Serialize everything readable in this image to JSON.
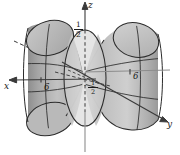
{
  "figure": {
    "kind": "3d-surface-plot",
    "surface_name": "hyperboloid-of-one-sheet",
    "background_color": "#ffffff",
    "outline_color": "#2b2b2b",
    "fill_light": "#d8d8d8",
    "fill_mid": "#b4b4b4",
    "fill_dark": "#9a9a9a",
    "fill_darker": "#8a8a8a"
  },
  "axes": {
    "z": {
      "label": "z",
      "direction": "up",
      "hidden_style": "dashed-below-origin"
    },
    "x": {
      "label": "x",
      "direction": "left",
      "hidden_style": "dashed-inside-surface"
    },
    "y": {
      "label": "y",
      "direction": "lower-right",
      "hidden_style": "solid"
    }
  },
  "ticks": [
    {
      "name": "x-tick-6",
      "text": "6",
      "axis": "x"
    },
    {
      "name": "y-tick-6",
      "text": "6",
      "axis": "y"
    }
  ],
  "fractions": [
    {
      "name": "z-top-half",
      "numerator": "1",
      "denominator": "2",
      "axis": "z",
      "position": "top"
    },
    {
      "name": "z-negative-half",
      "numerator": "1",
      "denominator": "2",
      "sign": "-",
      "axis": "z",
      "position": "center-bottom"
    }
  ]
}
